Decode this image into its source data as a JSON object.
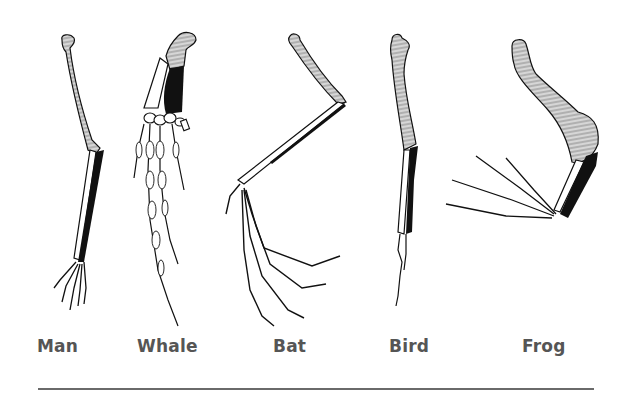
{
  "figure": {
    "limbs": [
      {
        "id": "man",
        "label": "Man"
      },
      {
        "id": "whale",
        "label": "Whale"
      },
      {
        "id": "bat",
        "label": "Bat"
      },
      {
        "id": "bird",
        "label": "Bird"
      },
      {
        "id": "frog",
        "label": "Frog"
      }
    ],
    "legend_fills": {
      "humerus": "hatched gray",
      "radius": "white",
      "ulna": "black",
      "hand": "white outlined"
    }
  },
  "colors": {
    "hatch": "#a8a8a8",
    "ink": "#111111",
    "label": "#555555",
    "rule": "#6a6a6a"
  }
}
